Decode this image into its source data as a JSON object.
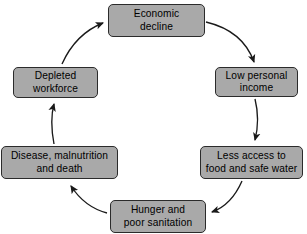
{
  "diagram": {
    "type": "cycle",
    "title": "",
    "direction": "clockwise",
    "box_fill_color": "#a9a9a9",
    "box_border_color": "#2b2b2b",
    "arrow_color": "#1a1a1a",
    "background_color": "#ffffff",
    "nodes": [
      {
        "id": "economic-decline",
        "label": "Economic\ndecline"
      },
      {
        "id": "low-income",
        "label": "Low personal\nincome"
      },
      {
        "id": "less-access",
        "label": "Less access to\nfood and safe water"
      },
      {
        "id": "hunger",
        "label": "Hunger and\npoor sanitation"
      },
      {
        "id": "disease",
        "label": "Disease, malnutrition\nand death"
      },
      {
        "id": "depleted",
        "label": "Depleted\nworkforce"
      }
    ],
    "edges": [
      {
        "from": "economic-decline",
        "to": "low-income",
        "arrowhead": "filled"
      },
      {
        "from": "low-income",
        "to": "less-access",
        "arrowhead": "filled"
      },
      {
        "from": "less-access",
        "to": "hunger",
        "arrowhead": "filled"
      },
      {
        "from": "hunger",
        "to": "disease",
        "arrowhead": "filled"
      },
      {
        "from": "disease",
        "to": "depleted",
        "arrowhead": "filled"
      },
      {
        "from": "depleted",
        "to": "economic-decline",
        "arrowhead": "filled"
      }
    ]
  }
}
